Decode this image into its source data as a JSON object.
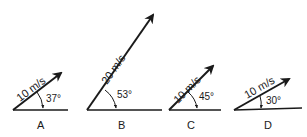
{
  "diagram": {
    "type": "velocity vectors",
    "vectors": [
      {
        "label": "A",
        "magnitude": "10 m/s",
        "angle": "37°"
      },
      {
        "label": "B",
        "magnitude": "20 m/s",
        "angle": "53°"
      },
      {
        "label": "C",
        "magnitude": "10 m/s",
        "angle": "45°"
      },
      {
        "label": "D",
        "magnitude": "10 m/s",
        "angle": "30°"
      }
    ],
    "colors": {
      "ink": "#1a1a1a",
      "background": "#ffffff"
    }
  }
}
